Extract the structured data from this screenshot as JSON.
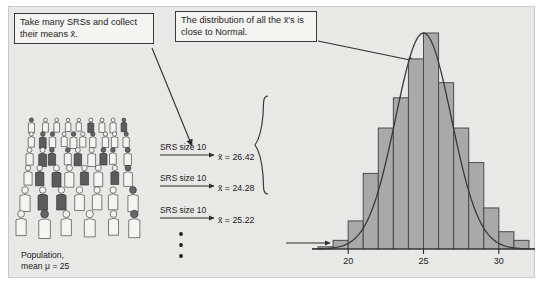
{
  "figure": {
    "background_color": "#e8e8e6",
    "panel_border_color": "#c9c9c6"
  },
  "callouts": [
    {
      "id": "take-many-srss",
      "text": "Take many SRSs and collect their means x̄."
    },
    {
      "id": "distribution-normal",
      "text": "The distribution of all the x̄'s is close to Normal."
    }
  ],
  "population": {
    "caption_line1": "Population,",
    "caption_line2": "mean μ = 25",
    "mean": 25,
    "illustration": "crowd-of-people"
  },
  "samples": {
    "size_label": "SRS size 10",
    "rows": [
      {
        "label": "SRS size 10",
        "result": "x̄ = 26.42",
        "value": 26.42
      },
      {
        "label": "SRS size 10",
        "result": "x̄ = 24.28",
        "value": 24.28
      },
      {
        "label": "SRS size 10",
        "result": "x̄ = 25.22",
        "value": 25.22
      }
    ],
    "continuation": "vertical-ellipsis"
  },
  "chart_data": {
    "type": "bar",
    "title": "",
    "xlabel": "",
    "ylabel": "",
    "grid": false,
    "legend": false,
    "axis_ticks": [
      20,
      25,
      30
    ],
    "xlim": [
      17.6,
      32.4
    ],
    "ylim": [
      0,
      100
    ],
    "bin_width": 1,
    "categories": [
      18,
      19,
      20,
      21,
      22,
      23,
      24,
      25,
      26,
      27,
      28,
      29,
      30,
      31
    ],
    "bin_centers": [
      18.5,
      19.5,
      20.5,
      21.5,
      22.5,
      23.5,
      24.5,
      25.5,
      26.5,
      27.5,
      28.5,
      29.5,
      30.5,
      31.5
    ],
    "values": [
      1,
      4,
      13,
      35,
      56,
      70,
      88,
      100,
      77,
      56,
      40,
      19,
      8,
      4
    ],
    "overlay": {
      "type": "normal-curve",
      "mean": 25,
      "label": "Normal density curve"
    },
    "bar_fill": "#a9a9a9",
    "bar_stroke": "#4a4a4a",
    "axis_color": "#2a2a2a"
  }
}
